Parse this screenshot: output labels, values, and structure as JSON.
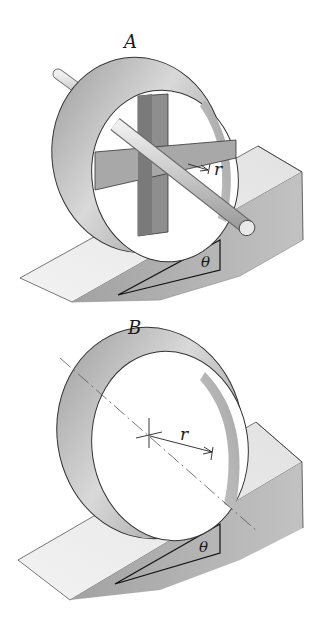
{
  "figure": {
    "panels": [
      {
        "id": "A",
        "label": "A",
        "description": "Hoop with cross-shaped plates and axle rolling on incline",
        "radius_label": "r",
        "angle_label": "θ"
      },
      {
        "id": "B",
        "label": "B",
        "description": "Thin hoop rolling on incline",
        "radius_label": "r",
        "angle_label": "θ"
      }
    ]
  },
  "colors": {
    "background": "#ffffff",
    "hoop_light": "#d8d8d8",
    "hoop_dark": "#8a8a8a",
    "incline_top": "#ececec",
    "incline_side": "#a9a9a9",
    "plate": "#8c8c8c",
    "outline": "#2a2a2a"
  }
}
